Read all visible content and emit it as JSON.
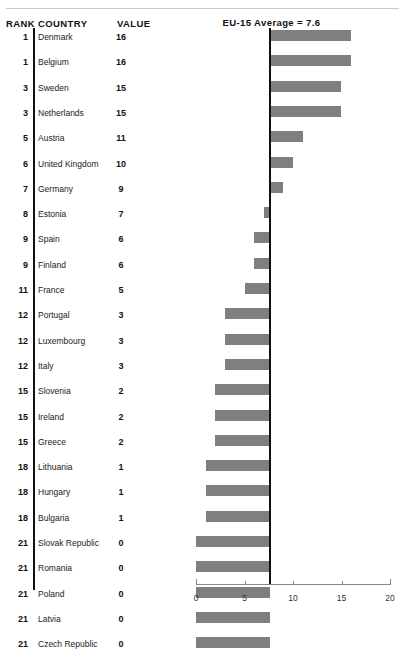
{
  "table": {
    "headers": {
      "rank": "RANK",
      "country": "COUNTRY",
      "value": "VALUE"
    },
    "rows": [
      {
        "rank": "1",
        "country": "Denmark",
        "value": "16"
      },
      {
        "rank": "1",
        "country": "Belgium",
        "value": "16"
      },
      {
        "rank": "3",
        "country": "Sweden",
        "value": "15"
      },
      {
        "rank": "3",
        "country": "Netherlands",
        "value": "15"
      },
      {
        "rank": "5",
        "country": "Austria",
        "value": "11"
      },
      {
        "rank": "6",
        "country": "United Kingdom",
        "value": "10"
      },
      {
        "rank": "7",
        "country": "Germany",
        "value": "9"
      },
      {
        "rank": "8",
        "country": "Estonia",
        "value": "7"
      },
      {
        "rank": "9",
        "country": "Spain",
        "value": "6"
      },
      {
        "rank": "9",
        "country": "Finland",
        "value": "6"
      },
      {
        "rank": "11",
        "country": "France",
        "value": "5"
      },
      {
        "rank": "12",
        "country": "Portugal",
        "value": "3"
      },
      {
        "rank": "12",
        "country": "Luxembourg",
        "value": "3"
      },
      {
        "rank": "12",
        "country": "Italy",
        "value": "3"
      },
      {
        "rank": "15",
        "country": "Slovenia",
        "value": "2"
      },
      {
        "rank": "15",
        "country": "Ireland",
        "value": "2"
      },
      {
        "rank": "15",
        "country": "Greece",
        "value": "2"
      },
      {
        "rank": "18",
        "country": "Lithuania",
        "value": "1"
      },
      {
        "rank": "18",
        "country": "Hungary",
        "value": "1"
      },
      {
        "rank": "18",
        "country": "Bulgaria",
        "value": "1"
      },
      {
        "rank": "21",
        "country": "Slovak Republic",
        "value": "0"
      },
      {
        "rank": "21",
        "country": "Romania",
        "value": "0"
      },
      {
        "rank": "21",
        "country": "Poland",
        "value": "0"
      },
      {
        "rank": "21",
        "country": "Latvia",
        "value": "0"
      },
      {
        "rank": "21",
        "country": "Czech Republic",
        "value": "0"
      }
    ]
  },
  "chart_data": {
    "type": "bar",
    "orientation": "horizontal",
    "title": "EU-15 Average = 7.6",
    "xlabel": "",
    "ylabel": "",
    "xlim": [
      0,
      20
    ],
    "xticks": [
      0,
      5,
      10,
      15,
      20
    ],
    "xticklabels": [
      "0",
      "5",
      "10",
      "15",
      "20"
    ],
    "grid": false,
    "legend": null,
    "reference_line": {
      "label": "EU-15 Average = 7.6",
      "value": 7.6,
      "color": "#111111"
    },
    "bar_style": {
      "mode": "deviation-from-reference",
      "color": "#7f7f7f"
    },
    "categories": [
      "Denmark",
      "Belgium",
      "Sweden",
      "Netherlands",
      "Austria",
      "United Kingdom",
      "Germany",
      "Estonia",
      "Spain",
      "Finland",
      "France",
      "Portugal",
      "Luxembourg",
      "Italy",
      "Slovenia",
      "Ireland",
      "Greece",
      "Lithuania",
      "Hungary",
      "Bulgaria",
      "Slovak Republic",
      "Romania",
      "Poland",
      "Latvia",
      "Czech Republic"
    ],
    "values": [
      16,
      16,
      15,
      15,
      11,
      10,
      9,
      7,
      6,
      6,
      5,
      3,
      3,
      3,
      2,
      2,
      2,
      1,
      1,
      1,
      0,
      0,
      0,
      0,
      0
    ],
    "ranks": [
      1,
      1,
      3,
      3,
      5,
      6,
      7,
      8,
      9,
      9,
      11,
      12,
      12,
      12,
      15,
      15,
      15,
      18,
      18,
      18,
      21,
      21,
      21,
      21,
      21
    ]
  }
}
